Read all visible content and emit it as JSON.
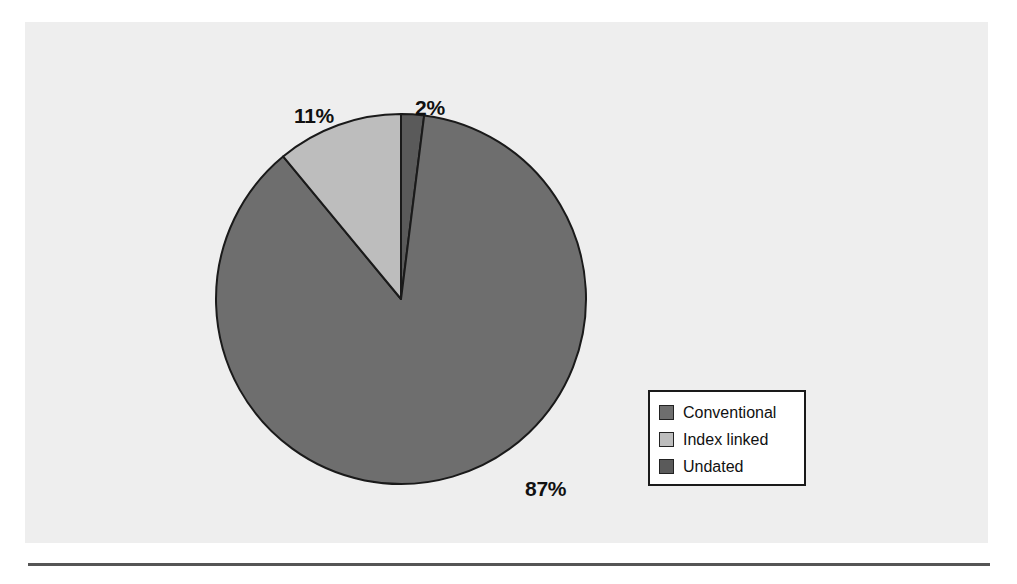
{
  "chart_data": {
    "type": "pie",
    "title": "",
    "categories": [
      "Conventional",
      "Index linked",
      "Undated"
    ],
    "values": [
      87,
      11,
      2
    ],
    "value_labels": [
      "87%",
      "11%",
      "2%"
    ],
    "unit": "percent",
    "total": 100,
    "start_angle_deg": 0,
    "direction": "clockwise",
    "legend_position": "right",
    "grid": false,
    "colors": [
      "#6e6e6e",
      "#bdbdbd",
      "#5a5a5a"
    ],
    "slice_order_clockwise_from_top": [
      "Undated",
      "Conventional",
      "Index linked"
    ],
    "slices": [
      {
        "label": "Conventional",
        "value": 87,
        "value_label": "87%",
        "color": "#6e6e6e"
      },
      {
        "label": "Index linked",
        "value": 11,
        "value_label": "11%",
        "color": "#bdbdbd"
      },
      {
        "label": "Undated",
        "value": 2,
        "value_label": "2%",
        "color": "#5a5a5a"
      }
    ]
  },
  "labels": {
    "conventional_pct": "87%",
    "index_linked_pct": "11%",
    "undated_pct": "2%"
  },
  "legend": {
    "items": [
      {
        "label": "Conventional",
        "color": "#6e6e6e"
      },
      {
        "label": "Index linked",
        "color": "#bdbdbd"
      },
      {
        "label": "Undated",
        "color": "#5a5a5a"
      }
    ]
  },
  "style": {
    "page_background": "#ffffff",
    "panel_background": "#eeeeee",
    "slice_outline": "#1a1a1a",
    "legend_border": "#1a1a1a",
    "legend_background": "#ffffff",
    "text_color": "#111111",
    "rule_color": "#555555"
  }
}
